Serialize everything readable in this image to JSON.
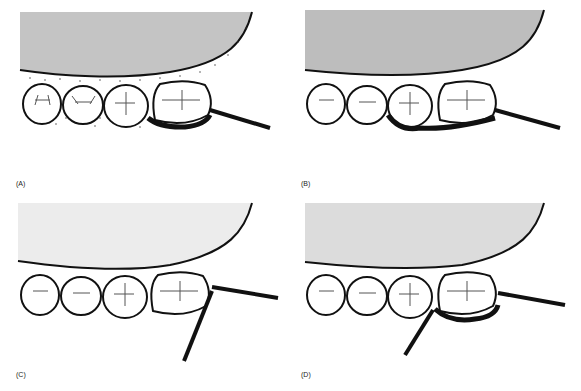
{
  "figure": {
    "panels": [
      {
        "id": "A",
        "label": "(A)",
        "gingiva_fill": "#c4c4c4",
        "highlight": "last-molar-distal-buccal",
        "instruments": 1
      },
      {
        "id": "B",
        "label": "(B)",
        "gingiva_fill": "#bdbdbd",
        "highlight": "two-molars-buccal",
        "instruments": 1
      },
      {
        "id": "C",
        "label": "(C)",
        "gingiva_fill": "#ececec",
        "highlight": "none",
        "instruments": 2
      },
      {
        "id": "D",
        "label": "(D)",
        "gingiva_fill": "#dcdcdc",
        "highlight": "last-molar-buccal",
        "instruments": 2
      }
    ],
    "colors": {
      "outline": "#111111",
      "background": "#ffffff",
      "stipple": "#333333"
    }
  }
}
